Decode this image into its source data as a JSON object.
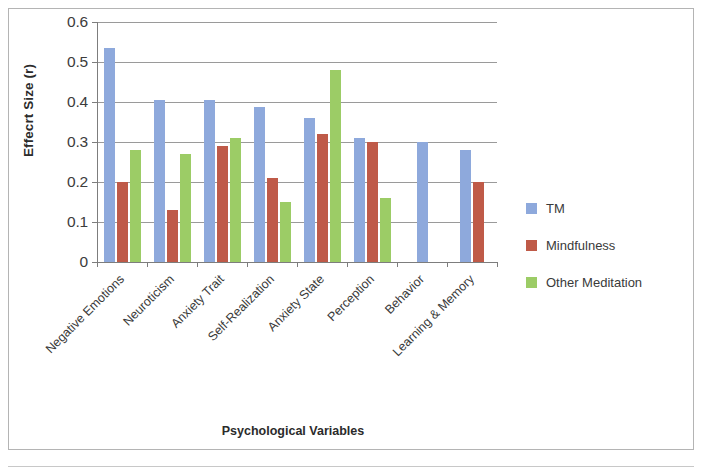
{
  "frame": {
    "border_color": "#b4b4b4"
  },
  "chart_data": {
    "type": "bar",
    "title": "",
    "xlabel": "Psychological Variables",
    "ylabel": "Effecrt Size (r)",
    "categories": [
      "Negative Emotions",
      "Neuroticism",
      "Anxiety Trait",
      "Self-Realization",
      "Anxiety State",
      "Perception",
      "Behavior",
      "Learning & Memory"
    ],
    "series": [
      {
        "name": "TM",
        "color": "#8ea9dc",
        "values": [
          0.535,
          0.405,
          0.405,
          0.388,
          0.36,
          0.31,
          0.3,
          0.28
        ]
      },
      {
        "name": "Mindfulness",
        "color": "#bf5a48",
        "values": [
          0.2,
          0.13,
          0.29,
          0.21,
          0.32,
          0.3,
          null,
          0.2
        ]
      },
      {
        "name": "Other Meditation",
        "color": "#9ccc66",
        "values": [
          0.28,
          0.27,
          0.31,
          0.15,
          0.48,
          0.16,
          null,
          null
        ]
      }
    ],
    "ylim": [
      0,
      0.6
    ],
    "ytick_labels": [
      "0.6",
      "0.5",
      "0.4",
      "0.3",
      "0.2",
      "0.1",
      "0"
    ],
    "ytick_values": [
      0.6,
      0.5,
      0.4,
      0.3,
      0.2,
      0.1,
      0
    ],
    "grid": true,
    "legend_position": "right"
  },
  "legend": {
    "entries": [
      {
        "label": "TM",
        "color": "#8ea9dc"
      },
      {
        "label": "Mindfulness",
        "color": "#bf5a48"
      },
      {
        "label": "Other Meditation",
        "color": "#9ccc66"
      }
    ]
  }
}
